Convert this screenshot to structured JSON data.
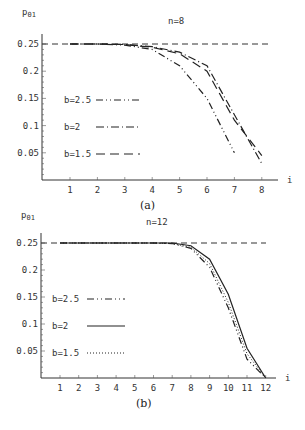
{
  "chart_data": [
    {
      "id": "a",
      "type": "line",
      "title": "n=8",
      "caption": "(a)",
      "xlabel": "i",
      "ylabel": "p01",
      "xlim": [
        0,
        8.5
      ],
      "ylim": [
        0,
        0.26
      ],
      "x_ticks": [
        "1",
        "2",
        "3",
        "4",
        "5",
        "6",
        "7",
        "8"
      ],
      "y_ticks": [
        "0.25",
        "0.2",
        "0.15",
        "0.1",
        "0.05"
      ],
      "grid": false,
      "reference_line": {
        "y": 0.25,
        "style": "dashed"
      },
      "legend_position": "inside-left",
      "series": [
        {
          "name": "b=2.5",
          "style": "dash-dot-dot",
          "x": [
            1,
            2,
            3,
            4,
            5,
            6,
            7
          ],
          "values": [
            0.25,
            0.25,
            0.248,
            0.24,
            0.21,
            0.15,
            0.05
          ]
        },
        {
          "name": "b=2",
          "style": "dash-dot",
          "x": [
            1,
            2,
            3,
            4,
            5,
            6,
            7,
            8
          ],
          "values": [
            0.25,
            0.25,
            0.249,
            0.245,
            0.235,
            0.21,
            0.12,
            0.03
          ]
        },
        {
          "name": "b=1.5",
          "style": "long-dash",
          "x": [
            1,
            2,
            3,
            4,
            5,
            6,
            7,
            8
          ],
          "values": [
            0.25,
            0.25,
            0.249,
            0.244,
            0.232,
            0.2,
            0.11,
            0.045
          ]
        }
      ]
    },
    {
      "id": "b",
      "type": "line",
      "title": "n=12",
      "caption": "(b)",
      "xlabel": "i",
      "ylabel": "p01",
      "xlim": [
        0,
        12.5
      ],
      "ylim": [
        0,
        0.26
      ],
      "x_ticks": [
        "1",
        "2",
        "3",
        "4",
        "5",
        "6",
        "7",
        "8",
        "9",
        "10",
        "11",
        "12"
      ],
      "y_ticks": [
        "0.25",
        "0.2",
        "0.15",
        "0.1",
        "0.05"
      ],
      "grid": false,
      "reference_line": {
        "y": 0.25,
        "style": "dashed"
      },
      "legend_position": "inside-left",
      "series": [
        {
          "name": "b=2.5",
          "style": "dash-dot-dot",
          "x": [
            1,
            2,
            3,
            4,
            5,
            6,
            7,
            8,
            9,
            10,
            11,
            12
          ],
          "values": [
            0.25,
            0.25,
            0.25,
            0.25,
            0.25,
            0.25,
            0.249,
            0.24,
            0.205,
            0.13,
            0.035,
            0
          ]
        },
        {
          "name": "b=2",
          "style": "solid",
          "x": [
            1,
            2,
            3,
            4,
            5,
            6,
            7,
            8,
            9,
            10,
            11,
            12
          ],
          "values": [
            0.25,
            0.25,
            0.25,
            0.25,
            0.25,
            0.25,
            0.25,
            0.245,
            0.22,
            0.155,
            0.055,
            0
          ]
        },
        {
          "name": "b=1.5",
          "style": "dotted",
          "x": [
            1,
            2,
            3,
            4,
            5,
            6,
            7,
            8,
            9,
            10,
            11,
            12
          ],
          "values": [
            0.25,
            0.25,
            0.25,
            0.25,
            0.25,
            0.25,
            0.249,
            0.242,
            0.212,
            0.14,
            0.045,
            0
          ]
        }
      ]
    }
  ]
}
